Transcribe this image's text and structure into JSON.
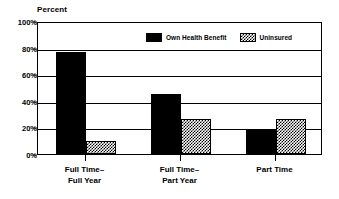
{
  "chart_data": {
    "type": "bar",
    "title": "",
    "subtitle": "",
    "xlabel": "",
    "ylabel": "Percent",
    "ylim": [
      0,
      100
    ],
    "yticks": [
      0,
      20,
      40,
      60,
      80,
      100
    ],
    "ytick_labels": [
      "0%",
      "20%",
      "40%",
      "60%",
      "80%",
      "100%"
    ],
    "grid": true,
    "legend_position": "upper center inside",
    "categories": [
      "Full Time–\nFull Year",
      "Full Time–\nPart Year",
      "Part Time"
    ],
    "category_lines": [
      [
        "Full Time–",
        "Full Year"
      ],
      [
        "Full Time–",
        "Part Year"
      ],
      [
        "Part Time",
        ""
      ]
    ],
    "series": [
      {
        "name": "Own Health Benefit",
        "fill": "solid-black",
        "color": "#000000",
        "values": [
          77,
          45,
          18
        ]
      },
      {
        "name": "Uninsured",
        "fill": "checker-hatch",
        "color": "#808080",
        "values": [
          10,
          26,
          26
        ]
      }
    ]
  },
  "axis": {
    "y_title": "Percent"
  },
  "legend": {
    "entries": [
      {
        "label": "Own Health Benefit",
        "swatch": "solid-swatch"
      },
      {
        "label": "Uninsured",
        "swatch": "hatch-swatch"
      }
    ]
  }
}
